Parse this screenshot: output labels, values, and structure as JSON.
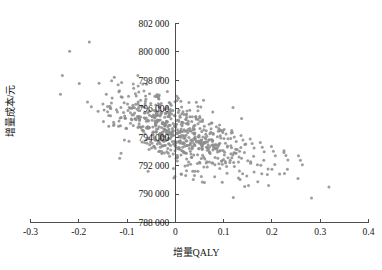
{
  "chart_data": {
    "type": "scatter",
    "title": "",
    "xlabel": "增量QALY",
    "ylabel": "增量成本/元",
    "xlim": [
      -0.3,
      0.4
    ],
    "ylim": [
      788000,
      802000
    ],
    "grid": false,
    "legend": "none",
    "x_ticks": [
      "-0.3",
      "-0.2",
      "-0.1",
      "0",
      "0.1",
      "0.2",
      "0.3",
      "0.4"
    ],
    "x_tick_values": [
      -0.3,
      -0.2,
      -0.1,
      0,
      0.1,
      0.2,
      0.3,
      0.4
    ],
    "y_ticks": [
      "788 000",
      "790 000",
      "792 000",
      "794 000",
      "796 000",
      "798 000",
      "800 000",
      "802 000"
    ],
    "y_tick_values": [
      788000,
      790000,
      792000,
      794000,
      796000,
      798000,
      800000,
      802000
    ],
    "axis_origin": {
      "x": 0,
      "y": 788000
    },
    "point_color": "#8c8c8c",
    "point_radius_px": 1.5,
    "n_points": 700,
    "series": [
      {
        "name": "PSA simulations",
        "center": [
          0.005,
          794300
        ],
        "correlation": -0.55,
        "sd_x": 0.062,
        "sd_y": 1500,
        "points": [
          [
            -0.219,
            800050
          ],
          [
            -0.234,
            798350
          ],
          [
            -0.199,
            797780
          ],
          [
            -0.158,
            797800
          ],
          [
            -0.143,
            797020
          ],
          [
            -0.182,
            796480
          ],
          [
            -0.174,
            796140
          ],
          [
            -0.16,
            795830
          ],
          [
            -0.131,
            796760
          ],
          [
            -0.117,
            797200
          ],
          [
            -0.106,
            796430
          ],
          [
            -0.122,
            795940
          ],
          [
            -0.138,
            795520
          ],
          [
            -0.149,
            795100
          ],
          [
            -0.097,
            796880
          ],
          [
            -0.088,
            796240
          ],
          [
            -0.079,
            795960
          ],
          [
            -0.112,
            795380
          ],
          [
            -0.127,
            794900
          ],
          [
            -0.101,
            794620
          ],
          [
            -0.072,
            796600
          ],
          [
            -0.064,
            796100
          ],
          [
            -0.057,
            795720
          ],
          [
            -0.083,
            795280
          ],
          [
            -0.093,
            794980
          ],
          [
            -0.069,
            794520
          ],
          [
            -0.051,
            796380
          ],
          [
            -0.044,
            795880
          ],
          [
            -0.038,
            795520
          ],
          [
            -0.06,
            795120
          ],
          [
            -0.076,
            794760
          ],
          [
            -0.047,
            794340
          ],
          [
            -0.033,
            796180
          ],
          [
            -0.028,
            795760
          ],
          [
            -0.022,
            795400
          ],
          [
            -0.041,
            795020
          ],
          [
            -0.055,
            794680
          ],
          [
            -0.031,
            794280
          ],
          [
            -0.018,
            796020
          ],
          [
            -0.013,
            795640
          ],
          [
            -0.009,
            795300
          ],
          [
            -0.025,
            794940
          ],
          [
            -0.036,
            794600
          ],
          [
            -0.016,
            794220
          ],
          [
            -0.005,
            795880
          ],
          [
            -0.002,
            795520
          ],
          [
            0.002,
            795180
          ],
          [
            -0.011,
            794840
          ],
          [
            -0.02,
            794500
          ],
          [
            -0.004,
            794140
          ],
          [
            0.006,
            795740
          ],
          [
            0.01,
            795400
          ],
          [
            0.014,
            795060
          ],
          [
            0.001,
            794720
          ],
          [
            -0.007,
            794400
          ],
          [
            0.008,
            794060
          ],
          [
            0.018,
            795600
          ],
          [
            0.022,
            795260
          ],
          [
            0.026,
            794920
          ],
          [
            0.012,
            794580
          ],
          [
            0.004,
            794260
          ],
          [
            0.02,
            793940
          ],
          [
            0.03,
            795440
          ],
          [
            0.034,
            795100
          ],
          [
            0.038,
            794780
          ],
          [
            0.024,
            794440
          ],
          [
            0.016,
            794120
          ],
          [
            0.032,
            793800
          ],
          [
            0.043,
            795280
          ],
          [
            0.047,
            794940
          ],
          [
            0.051,
            794620
          ],
          [
            0.036,
            794300
          ],
          [
            0.028,
            793980
          ],
          [
            0.044,
            793660
          ],
          [
            0.056,
            795100
          ],
          [
            0.06,
            794780
          ],
          [
            0.064,
            794460
          ],
          [
            0.049,
            794140
          ],
          [
            0.041,
            793820
          ],
          [
            0.057,
            793500
          ],
          [
            0.07,
            794920
          ],
          [
            0.074,
            794600
          ],
          [
            0.078,
            794280
          ],
          [
            0.062,
            793960
          ],
          [
            0.054,
            793640
          ],
          [
            0.071,
            793320
          ],
          [
            0.085,
            794740
          ],
          [
            0.089,
            794420
          ],
          [
            0.093,
            794100
          ],
          [
            0.077,
            793780
          ],
          [
            0.068,
            793460
          ],
          [
            0.086,
            793140
          ],
          [
            0.101,
            794540
          ],
          [
            0.105,
            794220
          ],
          [
            0.109,
            793900
          ],
          [
            0.092,
            793580
          ],
          [
            0.083,
            793260
          ],
          [
            0.102,
            792940
          ],
          [
            0.118,
            794340
          ],
          [
            0.122,
            794020
          ],
          [
            0.126,
            793700
          ],
          [
            0.108,
            793380
          ],
          [
            0.099,
            793060
          ],
          [
            0.119,
            792740
          ],
          [
            0.136,
            794120
          ],
          [
            0.14,
            793800
          ],
          [
            0.144,
            793480
          ],
          [
            0.125,
            793160
          ],
          [
            0.115,
            792840
          ],
          [
            0.137,
            792520
          ],
          [
            0.155,
            793880
          ],
          [
            0.159,
            793560
          ],
          [
            0.163,
            793240
          ],
          [
            0.143,
            792920
          ],
          [
            0.132,
            792600
          ],
          [
            0.156,
            792280
          ],
          [
            0.176,
            793620
          ],
          [
            0.18,
            793300
          ],
          [
            0.184,
            792980
          ],
          [
            0.162,
            792660
          ],
          [
            0.15,
            792340
          ],
          [
            0.177,
            792020
          ],
          [
            0.199,
            793340
          ],
          [
            0.203,
            793020
          ],
          [
            0.207,
            792700
          ],
          [
            0.183,
            792380
          ],
          [
            0.17,
            792060
          ],
          [
            0.2,
            791740
          ],
          [
            0.225,
            793040
          ],
          [
            0.229,
            792720
          ],
          [
            0.233,
            792400
          ],
          [
            0.206,
            792080
          ],
          [
            0.192,
            791760
          ],
          [
            0.226,
            791440
          ],
          [
            0.255,
            792700
          ],
          [
            0.259,
            792380
          ],
          [
            0.263,
            792060
          ],
          [
            0.232,
            791740
          ],
          [
            0.216,
            791420
          ],
          [
            0.254,
            791100
          ],
          [
            0.282,
            789720
          ],
          [
            0.318,
            790500
          ],
          [
            0.12,
            789760
          ],
          [
            0.148,
            791280
          ],
          [
            0.163,
            791560
          ],
          [
            0.134,
            791020
          ],
          [
            0.107,
            791460
          ],
          [
            0.092,
            791800
          ],
          [
            0.076,
            792180
          ],
          [
            0.061,
            792460
          ],
          [
            0.046,
            792760
          ],
          [
            0.031,
            793020
          ],
          [
            0.015,
            793300
          ],
          [
            0.0,
            793560
          ],
          [
            -0.015,
            793840
          ],
          [
            -0.03,
            794100
          ],
          [
            -0.045,
            794380
          ],
          [
            -0.06,
            794660
          ],
          [
            -0.075,
            794940
          ],
          [
            -0.09,
            795220
          ],
          [
            -0.105,
            795500
          ],
          [
            -0.12,
            795780
          ],
          [
            -0.135,
            796060
          ],
          [
            -0.15,
            796340
          ],
          [
            0.104,
            792180
          ],
          [
            0.088,
            792520
          ],
          [
            0.072,
            792860
          ],
          [
            0.056,
            793180
          ],
          [
            0.04,
            793460
          ],
          [
            0.024,
            793740
          ],
          [
            0.008,
            794020
          ],
          [
            -0.008,
            794300
          ],
          [
            -0.024,
            794580
          ],
          [
            -0.04,
            794860
          ],
          [
            -0.056,
            795140
          ],
          [
            -0.072,
            795420
          ],
          [
            0.066,
            791900
          ],
          [
            0.05,
            792240
          ],
          [
            0.034,
            792580
          ],
          [
            0.018,
            792900
          ],
          [
            0.002,
            793220
          ],
          [
            -0.014,
            793540
          ],
          [
            -0.03,
            793860
          ],
          [
            -0.046,
            794180
          ],
          [
            0.036,
            791600
          ],
          [
            0.02,
            791980
          ],
          [
            0.004,
            792320
          ],
          [
            -0.012,
            792660
          ],
          [
            -0.028,
            793000
          ],
          [
            -0.044,
            793340
          ],
          [
            0.012,
            791420
          ],
          [
            -0.004,
            791800
          ]
        ]
      }
    ]
  },
  "axis_title_x": "增量QALY",
  "axis_title_y": "增量成本/元"
}
